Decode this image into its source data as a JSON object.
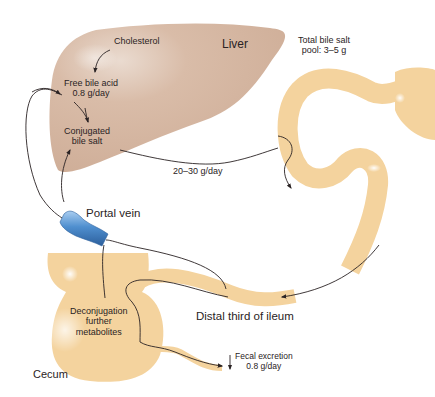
{
  "colors": {
    "liver": "#d8b9a3",
    "intestine": "#f4d39e",
    "portal_vein": "#4f8fcf",
    "arrow": "#2a2324",
    "text": "#2a2324"
  },
  "organs": {
    "liver": "Liver",
    "portal_vein": "Portal vein",
    "cecum": "Cecum",
    "ileum": "Distal third of ileum"
  },
  "liver_labels": {
    "cholesterol": "Cholesterol",
    "free_bile_acid_line1": "Free bile acid",
    "free_bile_acid_line2": "0.8 g/day",
    "conjugated_line1": "Conjugated",
    "conjugated_line2": "bile salt"
  },
  "flows": {
    "biliary_secretion": "20–30 g/day",
    "pool_line1": "Total bile salt",
    "pool_line2": "pool: 3–5 g",
    "fecal_line1": "Fecal excretion",
    "fecal_line2": "0.8 g/day"
  },
  "cecum_labels": {
    "line1": "Deconjugation",
    "line2": "further",
    "line3": "metabolites"
  }
}
